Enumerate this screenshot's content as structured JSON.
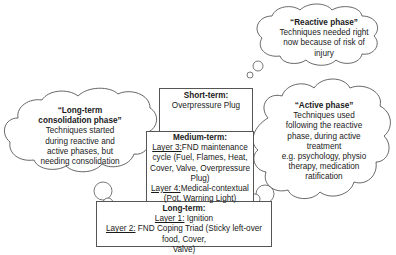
{
  "diagram": {
    "clouds": {
      "reactive": {
        "title": "“Reactive phase”",
        "lines": [
          "Techniques needed right",
          "now because of risk of",
          "injury"
        ]
      },
      "long_term_consolidation": {
        "title_line1": "“Long-term",
        "title_line2": "consolidation phase”",
        "lines": [
          "Techniques started",
          "during reactive and",
          "active phases, but",
          "needing consolidation"
        ]
      },
      "active": {
        "title": "“Active phase”",
        "lines": [
          "Techniques used",
          "following the reactive",
          "phase, during active",
          "treatment",
          "e.g. psychology, physio",
          "therapy, medication",
          "ratification"
        ]
      }
    },
    "boxes": {
      "short_term": {
        "heading": "Short-term:",
        "text": "Overpressure Plug"
      },
      "medium_term": {
        "heading": "Medium-term:",
        "layer3_label": "Layer 3:",
        "layer3_line1": "FND maintenance",
        "layer3_line2": "cycle (Fuel, Flames, Heat,",
        "layer3_line3": "Cover, Valve, Overpressure",
        "layer3_line4": "Plug)",
        "layer4_label": "Layer 4:",
        "layer4_line1": "Medical-contextual",
        "layer4_line2": "(Pot, Warning Light)"
      },
      "long_term": {
        "heading": "Long-term:",
        "layer1_label": "Layer 1:",
        "layer1_text": " Ignition",
        "layer2_label": "Layer 2:",
        "layer2_line1": " FND Coping Triad (Sticky left-over food, Cover,",
        "layer2_line2": "Valve)"
      }
    },
    "colors": {
      "stroke": "#555555",
      "text": "#1a1a1a",
      "background": "#ffffff"
    }
  }
}
